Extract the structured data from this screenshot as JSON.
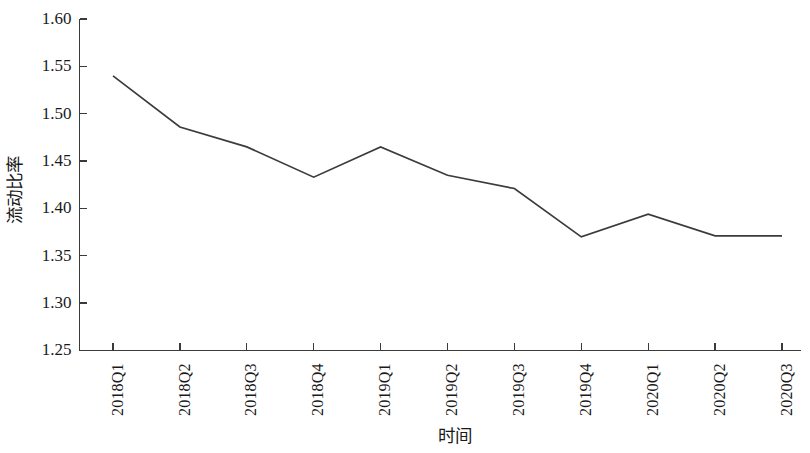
{
  "chart_data": {
    "type": "line",
    "title": "",
    "xlabel": "时间",
    "ylabel": "流动比率",
    "categories": [
      "2018Q1",
      "2018Q2",
      "2018Q3",
      "2018Q4",
      "2019Q1",
      "2019Q2",
      "2019Q3",
      "2019Q4",
      "2020Q1",
      "2020Q2",
      "2020Q3"
    ],
    "values": [
      1.54,
      1.486,
      1.465,
      1.433,
      1.465,
      1.435,
      1.421,
      1.37,
      1.394,
      1.371,
      1.371
    ],
    "series": [
      {
        "name": "流动比率",
        "values": [
          1.54,
          1.486,
          1.465,
          1.433,
          1.465,
          1.435,
          1.421,
          1.37,
          1.394,
          1.371,
          1.371
        ]
      }
    ],
    "ylim": [
      1.25,
      1.6
    ],
    "ytick_labels": [
      "1.60",
      "1.55",
      "1.50",
      "1.45",
      "1.40",
      "1.35",
      "1.30",
      "1.25"
    ],
    "ytick_values": [
      1.6,
      1.55,
      1.5,
      1.45,
      1.4,
      1.35,
      1.3,
      1.25
    ],
    "grid": false,
    "legend": false,
    "legend_position": "none",
    "line_color": "#3b3b3b",
    "axis_color": "#3a3a3a",
    "background_color": "#ffffff"
  },
  "axis": {
    "y_title": "流动比率",
    "x_title": "时间"
  }
}
